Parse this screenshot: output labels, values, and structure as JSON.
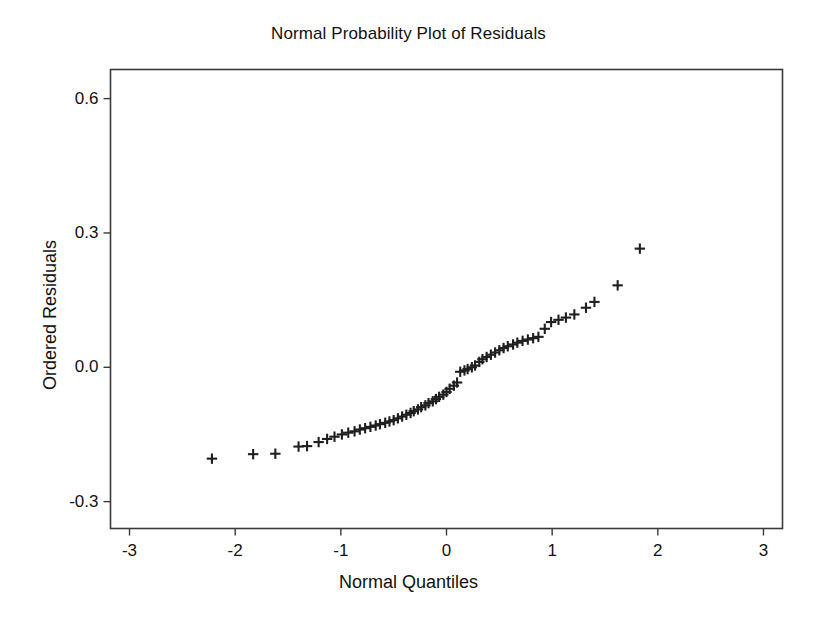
{
  "figure": {
    "background_color": "#ffffff",
    "frame_color": "#3a3a3a",
    "marker_color": "#1f1f1f"
  },
  "chart_data": {
    "type": "scatter",
    "title": "Normal Probability Plot of Residuals",
    "xlabel": "Normal Quantiles",
    "ylabel": "Ordered Residuals",
    "xlim": [
      -3.18,
      3.18
    ],
    "ylim": [
      -0.36,
      0.665
    ],
    "xticks": [
      -3,
      -2,
      -1,
      0,
      1,
      2,
      3
    ],
    "xtick_labels": [
      "-3",
      "-2",
      "-1",
      "0",
      "1",
      "2",
      "3"
    ],
    "yticks": [
      -0.3,
      0.0,
      0.3,
      0.6
    ],
    "ytick_labels": [
      "-0.3",
      "0.0",
      "0.3",
      "0.6"
    ],
    "grid": false,
    "legend": null,
    "marker": "plus",
    "series": [
      {
        "name": "Ordered Residuals",
        "n_points": 78,
        "x": [
          -2.22,
          -1.83,
          -1.62,
          -1.4,
          -1.32,
          -1.21,
          -1.13,
          -1.06,
          -0.99,
          -0.93,
          -0.87,
          -0.82,
          -0.77,
          -0.72,
          -0.67,
          -0.63,
          -0.58,
          -0.54,
          -0.5,
          -0.46,
          -0.42,
          -0.38,
          -0.34,
          -0.31,
          -0.27,
          -0.24,
          -0.2,
          -0.17,
          -0.13,
          -0.1,
          -0.07,
          -0.03,
          0.0,
          0.03,
          0.07,
          0.1,
          0.13,
          0.17,
          0.2,
          0.24,
          0.27,
          0.31,
          0.34,
          0.38,
          0.42,
          0.46,
          0.5,
          0.54,
          0.58,
          0.63,
          0.67,
          0.72,
          0.77,
          0.82,
          0.87,
          0.93,
          0.99,
          1.06,
          1.13,
          1.21,
          1.32,
          1.4,
          1.62,
          1.83
        ],
        "y": [
          -0.204,
          -0.194,
          -0.193,
          -0.177,
          -0.176,
          -0.167,
          -0.16,
          -0.155,
          -0.15,
          -0.146,
          -0.143,
          -0.139,
          -0.136,
          -0.133,
          -0.13,
          -0.127,
          -0.124,
          -0.121,
          -0.118,
          -0.114,
          -0.11,
          -0.106,
          -0.102,
          -0.098,
          -0.094,
          -0.089,
          -0.085,
          -0.08,
          -0.076,
          -0.071,
          -0.066,
          -0.061,
          -0.055,
          -0.048,
          -0.041,
          -0.034,
          -0.01,
          -0.007,
          -0.004,
          0.0,
          0.004,
          0.012,
          0.018,
          0.023,
          0.028,
          0.033,
          0.038,
          0.043,
          0.047,
          0.051,
          0.055,
          0.059,
          0.062,
          0.065,
          0.068,
          0.086,
          0.101,
          0.106,
          0.111,
          0.118,
          0.133,
          0.146,
          0.183,
          0.265
        ]
      }
    ]
  }
}
